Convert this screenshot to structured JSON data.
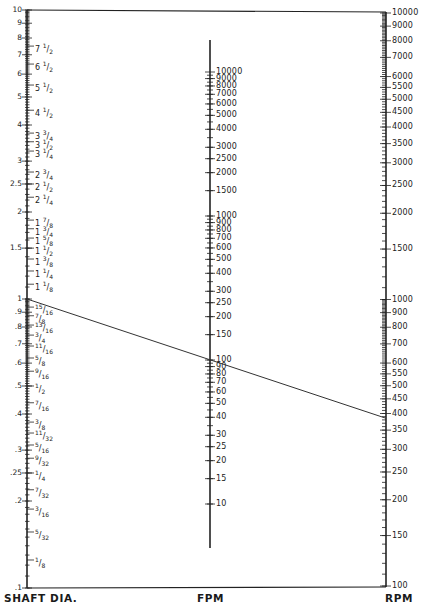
{
  "chart_data": {
    "type": "nomograph",
    "title": "",
    "axes": [
      {
        "name": "SHAFT DIA.",
        "scale": "log",
        "range": [
          0.1,
          10
        ],
        "decimal_labels": [
          "10",
          "9",
          "8",
          "7",
          "6",
          "5",
          "4",
          "3",
          "2.5",
          "2",
          "1.5",
          "1",
          ".9",
          ".8",
          ".7",
          ".6",
          ".5",
          ".4",
          ".3",
          ".25",
          ".2",
          ".1"
        ],
        "fraction_labels": [
          "7 1/2",
          "6 1/2",
          "5 1/2",
          "4 1/2",
          "3 3/4",
          "3 1/2",
          "3 1/4",
          "2 3/4",
          "2 1/2",
          "2 1/4",
          "1 7/8",
          "1 3/4",
          "1 5/8",
          "1 1/2",
          "1 3/8",
          "1 1/4",
          "1 1/8",
          "15/16",
          "7/8",
          "13/16",
          "3/4",
          "11/16",
          "5/8",
          "9/16",
          "1/2",
          "7/16",
          "3/8",
          "11/32",
          "5/16",
          "9/32",
          "1/4",
          "7/32",
          "3/16",
          "5/32",
          "1/8"
        ]
      },
      {
        "name": "FPM",
        "scale": "log",
        "range": [
          10,
          10000
        ],
        "labels": [
          "10000",
          "9000",
          "8000",
          "7000",
          "6000",
          "5000",
          "4000",
          "3000",
          "2500",
          "2000",
          "1500",
          "1000",
          "900",
          "800",
          "700",
          "600",
          "500",
          "400",
          "300",
          "250",
          "200",
          "150",
          "100",
          "90",
          "80",
          "70",
          "60",
          "50",
          "40",
          "30",
          "25",
          "20",
          "15",
          "10"
        ]
      },
      {
        "name": "RPM",
        "scale": "log",
        "range": [
          100,
          10000
        ],
        "labels": [
          "10000",
          "9000",
          "8000",
          "7000",
          "6000",
          "5500",
          "5000",
          "4500",
          "4000",
          "3500",
          "3000",
          "2500",
          "2000",
          "1500",
          "1000",
          "900",
          "800",
          "700",
          "600",
          "550",
          "500",
          "450",
          "400",
          "350",
          "300",
          "250",
          "200",
          "150",
          "100"
        ]
      }
    ],
    "example_line": {
      "shaft_dia": 1,
      "fpm": 100,
      "rpm": 385
    }
  },
  "labels": {
    "shaft": "SHAFT DIA.",
    "fpm": "FPM",
    "rpm": "RPM"
  }
}
